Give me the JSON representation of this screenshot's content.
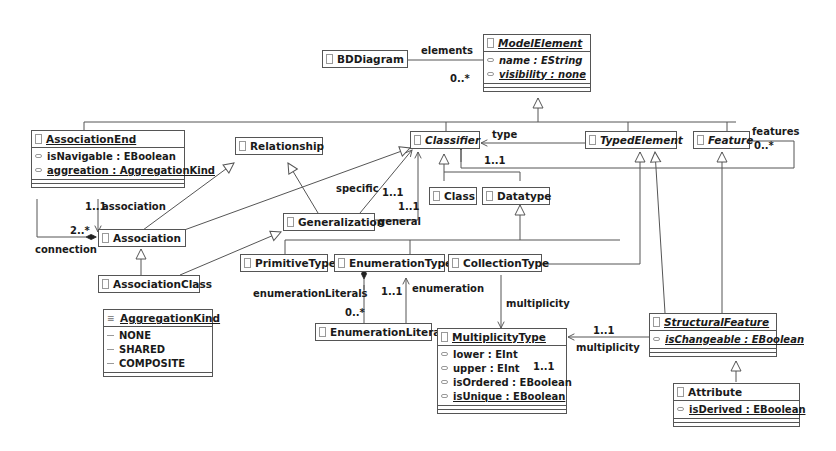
{
  "classes": {
    "bddiagram": {
      "name": "BDDiagram"
    },
    "modelelement": {
      "name": "ModelElement",
      "attrs": [
        "name : EString",
        "visibility : none"
      ]
    },
    "associationend": {
      "name": "AssociationEnd",
      "attrs": [
        "isNavigable : EBoolean",
        "aggreation : AggregationKind"
      ]
    },
    "relationship": {
      "name": "Relationship"
    },
    "classifier": {
      "name": "Classifier"
    },
    "typedelement": {
      "name": "TypedElement"
    },
    "feature": {
      "name": "Feature"
    },
    "class": {
      "name": "Class"
    },
    "datatype": {
      "name": "Datatype"
    },
    "generalization": {
      "name": "Generalization"
    },
    "association": {
      "name": "Association"
    },
    "associationclass": {
      "name": "AssociationClass"
    },
    "primitivetype": {
      "name": "PrimitiveType"
    },
    "enumerationtype": {
      "name": "EnumerationType"
    },
    "collectiontype": {
      "name": "CollectionType"
    },
    "aggregationkind": {
      "name": "AggregationKind",
      "literals": [
        "NONE",
        "SHARED",
        "COMPOSITE"
      ]
    },
    "enumerationliteral": {
      "name": "EnumerationLiteral"
    },
    "multiplicitytype": {
      "name": "MultiplicityType",
      "attrs": [
        "lower : EInt",
        "upper : EInt",
        "isOrdered : EBoolean",
        "isUnique : EBoolean"
      ]
    },
    "structuralfeature": {
      "name": "StructuralFeature",
      "attrs": [
        "isChangeable : EBoolean"
      ]
    },
    "attribute": {
      "name": "Attribute",
      "attrs": [
        "isDerived : EBoolean"
      ]
    }
  },
  "labels": {
    "elements": "elements",
    "elements_mult": "0..*",
    "association": "association",
    "association_mult": "1..1",
    "connection": "connection",
    "connection_mult": "2..*",
    "type": "type",
    "features": "features",
    "features_mult": "0..*",
    "classifier_mult": "1..1",
    "specific": "specific",
    "specific_mult": "1..1",
    "general": "general",
    "general_mult": "1..1",
    "enumerationLiterals": "enumerationLiterals",
    "enumerationLiterals_mult": "0..*",
    "enumeration": "enumeration",
    "enumeration_mult": "1..1",
    "multiplicity_collection": "multiplicity",
    "multiplicity_collection_mult": "1..1",
    "multiplicity_sf": "multiplicity",
    "multiplicity_sf_mult": "1..1"
  },
  "colors": {
    "line": "#555555",
    "border": "#555555"
  }
}
